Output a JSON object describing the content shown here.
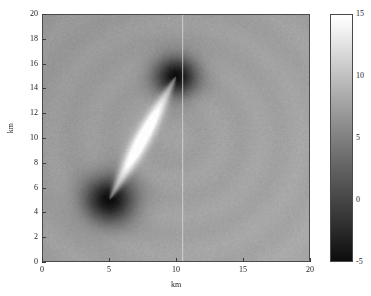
{
  "figure": {
    "type": "heatmap-figure",
    "background_color": "#ffffff"
  },
  "axes": {
    "x": {
      "label": "km",
      "ticks": [
        "0",
        "5",
        "10",
        "15",
        "20"
      ],
      "tick_values": [
        0,
        5,
        10,
        15,
        20
      ],
      "range": [
        0,
        20
      ]
    },
    "y": {
      "label": "km",
      "ticks": [
        "0",
        "2",
        "4",
        "6",
        "8",
        "10",
        "12",
        "14",
        "16",
        "18",
        "20"
      ],
      "tick_values": [
        0,
        2,
        4,
        6,
        8,
        10,
        12,
        14,
        16,
        18,
        20
      ],
      "range": [
        0,
        20
      ]
    }
  },
  "colorbar": {
    "ticks": [
      "15",
      "10",
      "5",
      "0",
      "-5"
    ],
    "tick_values": [
      15,
      10,
      5,
      0,
      -5
    ],
    "range": [
      -5,
      15
    ],
    "colormap": "gray",
    "orientation": "vertical",
    "position": "right"
  },
  "chart_data": {
    "type": "heatmap",
    "title": "",
    "xlabel": "km",
    "ylabel": "km",
    "xlim": [
      0,
      20
    ],
    "ylim": [
      0,
      20
    ],
    "clim": [
      -5,
      15
    ],
    "colormap": "gray",
    "grid": false,
    "legend": "none",
    "background_value": 7.5,
    "noise_amplitude": 0.6,
    "features": [
      {
        "kind": "bright-lens-streak",
        "description": "elongated bright lens-shaped ridge joining two source points",
        "endpoint_a": [
          5.0,
          5.0
        ],
        "endpoint_b": [
          10.0,
          15.0
        ],
        "peak_value": 15,
        "half_width_km": 0.85
      },
      {
        "kind": "dark-halo",
        "description": "diffuse dark circular depression centred on lower source",
        "center": [
          5.0,
          5.0
        ],
        "radius_km": 2.6,
        "min_value": -4
      },
      {
        "kind": "dark-halo",
        "description": "diffuse dark circular depression centred on upper source",
        "center": [
          10.0,
          15.0
        ],
        "radius_km": 2.2,
        "min_value": -4
      },
      {
        "kind": "vertical-line",
        "description": "faint bright vertical line artefact",
        "x": 10.5,
        "value": 9.5
      },
      {
        "kind": "horizontal-gradient",
        "description": "background brightens gently toward right and lower edges",
        "from_value": 6.8,
        "to_value": 8.2
      }
    ],
    "sample_points": [
      {
        "x": 1.0,
        "y": 19.0,
        "value": 7.0
      },
      {
        "x": 10.0,
        "y": 19.0,
        "value": 6.6
      },
      {
        "x": 19.0,
        "y": 19.0,
        "value": 7.4
      },
      {
        "x": 1.0,
        "y": 10.0,
        "value": 7.2
      },
      {
        "x": 19.0,
        "y": 10.0,
        "value": 8.0
      },
      {
        "x": 1.0,
        "y": 1.0,
        "value": 7.4
      },
      {
        "x": 10.0,
        "y": 1.0,
        "value": 7.8
      },
      {
        "x": 19.0,
        "y": 1.0,
        "value": 8.2
      },
      {
        "x": 7.5,
        "y": 10.0,
        "value": 15.0
      },
      {
        "x": 5.0,
        "y": 5.0,
        "value": -4.0
      },
      {
        "x": 10.0,
        "y": 15.0,
        "value": -4.0
      },
      {
        "x": 3.0,
        "y": 4.0,
        "value": 1.5
      },
      {
        "x": 12.0,
        "y": 16.0,
        "value": 3.0
      }
    ]
  }
}
